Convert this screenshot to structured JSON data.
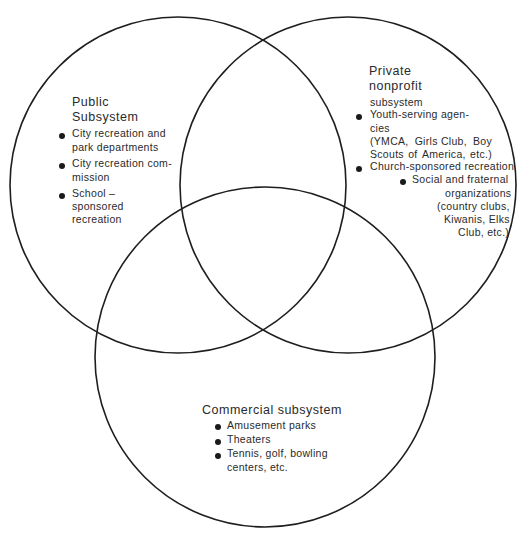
{
  "diagram": {
    "type": "venn",
    "circles": [
      {
        "name": "public",
        "cx": 178,
        "cy": 185,
        "r": 168
      },
      {
        "name": "private-nonprofit",
        "cx": 348,
        "cy": 185,
        "r": 168
      },
      {
        "name": "commercial",
        "cx": 265,
        "cy": 357,
        "r": 170
      }
    ],
    "stroke_color": "#1e1e1e"
  },
  "public": {
    "title_line1": "Public",
    "title_line2": "Subsystem",
    "items": [
      {
        "lines": [
          "City recreation and",
          "park departments"
        ]
      },
      {
        "lines": [
          "City recreation com-",
          "mission"
        ]
      },
      {
        "lines": [
          "School –",
          "sponsored",
          "recreation"
        ]
      }
    ]
  },
  "private": {
    "title_line1": "Private",
    "title_line2": "nonprofit",
    "title_line3": "subsystem",
    "items": [
      {
        "lines": [
          "Youth-serving agen-",
          "cies"
        ]
      },
      {
        "lines": [
          "(YMCA,",
          "Girls Club,",
          "Boy"
        ]
      },
      {
        "lines": [
          "Scouts",
          "of",
          "America,",
          "etc.)"
        ]
      },
      {
        "lines": [
          "Church-sponsored recreation"
        ]
      },
      {
        "lines": [
          "Social and fraternal",
          "organizations",
          "(country clubs,",
          "Kiwanis, Elks",
          "Club, etc.)"
        ]
      }
    ]
  },
  "commercial": {
    "title": "Commercial subsystem",
    "items": [
      {
        "lines": [
          "Amusement parks"
        ]
      },
      {
        "lines": [
          "Theaters"
        ]
      },
      {
        "lines": [
          "Tennis, golf, bowling",
          "centers, etc."
        ]
      }
    ]
  }
}
